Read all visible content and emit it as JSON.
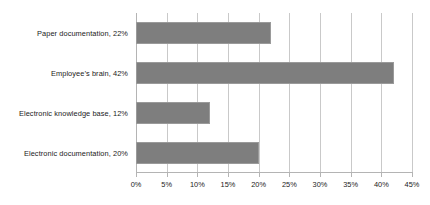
{
  "chart_data": {
    "type": "bar",
    "orientation": "horizontal",
    "title": "",
    "xlabel": "",
    "ylabel": "",
    "categories": [
      "Paper documentation",
      "Employee’s brain",
      "Electronic knowledge base",
      "Electronic documentation"
    ],
    "values": [
      22,
      42,
      12,
      20
    ],
    "value_labels": [
      "22%",
      "42%",
      "12%",
      "20%"
    ],
    "category_labels": [
      "Paper documentation, 22%",
      "Employee’s brain, 42%",
      "Electronic knowledge base, 12%",
      "Electronic documentation, 20%"
    ],
    "xlim": [
      0,
      45
    ],
    "xticks": [
      0,
      5,
      10,
      15,
      20,
      25,
      30,
      35,
      40,
      45
    ],
    "xtick_labels": [
      "0%",
      "5%",
      "10%",
      "15%",
      "20%",
      "25%",
      "30%",
      "35%",
      "40%",
      "45%"
    ],
    "grid": true,
    "grid_axis": "x",
    "legend": false,
    "legend_position": "none",
    "colors": {
      "bar_fill": "#7e7e7e",
      "bar_border": "#9a9a9a",
      "gridline": "#c9c9c9",
      "axis": "#b4b4b4",
      "text": "#1a1a1a",
      "background": "#ffffff"
    }
  }
}
